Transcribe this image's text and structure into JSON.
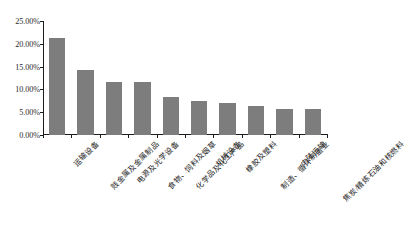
{
  "chart_data": {
    "type": "bar",
    "title": "",
    "xlabel": "",
    "ylabel": "",
    "ylim": [
      0,
      25
    ],
    "ytick_labels": [
      "25.00%",
      "20.00%",
      "15.00%",
      "10.00%",
      "5.00%",
      "0.00%"
    ],
    "ytick_values": [
      25,
      20,
      15,
      10,
      5,
      0
    ],
    "grid": false,
    "legend": null,
    "bar_color": "#7d7d7d",
    "axis_color": "#1c1c1c",
    "categories": [
      "运输设备",
      "贱金属及金属制品",
      "电源及光学设备",
      "食物、饲料及烟草",
      "化学品及化工产品",
      "机械设备",
      "橡胶及塑料",
      "制造、循环制造业",
      "内陆运输",
      "焦炭/精炼石油和核燃料"
    ],
    "values": [
      21.3,
      14.3,
      11.6,
      11.6,
      8.3,
      7.4,
      7.0,
      6.4,
      5.8,
      5.6
    ],
    "value_labels": [
      "21.30%",
      "14.30%",
      "11.60%",
      "11.60%",
      "8.30%",
      "7.40%",
      "7.00%",
      "6.40%",
      "5.80%",
      "5.60%"
    ]
  }
}
